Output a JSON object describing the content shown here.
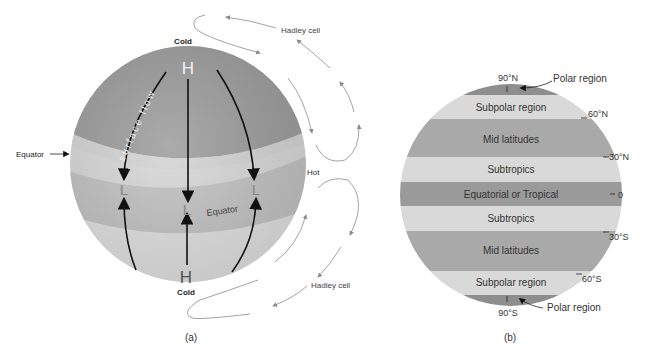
{
  "panel_a": {
    "caption": "(a)",
    "labels": {
      "cold_top": "Cold",
      "cold_bottom": "Cold",
      "high_top": "H",
      "high_bottom": "H",
      "low_left": "L",
      "low_center": "L",
      "low_right": "L",
      "surface_flow": "surface flow",
      "equator_outside": "Equator",
      "equator_inside": "Equator",
      "hot": "Hot",
      "hadley_top": "Hadley cell",
      "hadley_bottom": "Hadley cell"
    },
    "colors": {
      "polar_cap": "#9a9a9a",
      "mid_band": "#c9c9c9",
      "equator_band": "#b8b8b8",
      "lower_band": "#d6d6d6",
      "arrow": "#111111",
      "cell_arrow": "#8a8a8a"
    }
  },
  "panel_b": {
    "caption": "(b)",
    "bands": [
      {
        "name": "Polar region",
        "label": "",
        "color": "#8e8e8e"
      },
      {
        "name": "Subpolar region",
        "label": "Subpolar region",
        "color": "#d9d9d9"
      },
      {
        "name": "Mid latitudes",
        "label": "Mid latitudes",
        "color": "#a9a9a9"
      },
      {
        "name": "Subtropics",
        "label": "Subtropics",
        "color": "#d9d9d9"
      },
      {
        "name": "Equatorial or Tropical",
        "label": "Equatorial or Tropical",
        "color": "#9a9a9a"
      },
      {
        "name": "Subtropics",
        "label": "Subtropics",
        "color": "#d9d9d9"
      },
      {
        "name": "Mid latitudes",
        "label": "Mid latitudes",
        "color": "#a9a9a9"
      },
      {
        "name": "Subpolar region",
        "label": "Subpolar region",
        "color": "#d9d9d9"
      },
      {
        "name": "Polar region",
        "label": "",
        "color": "#8e8e8e"
      }
    ],
    "latitudes": {
      "n90": "90°N",
      "n60": "60°N",
      "n30": "30°N",
      "eq": "0",
      "s30": "30°S",
      "s60": "60°S",
      "s90": "90°S"
    },
    "polar_north_label": "Polar region",
    "polar_south_label": "Polar region"
  }
}
